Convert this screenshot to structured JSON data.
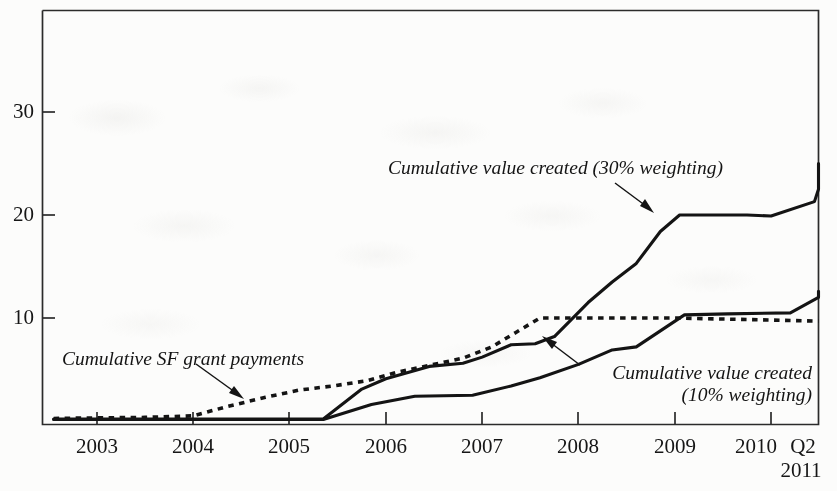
{
  "chart_data": {
    "type": "line",
    "title": "",
    "subtitle": "",
    "xlabel": "",
    "ylabel": "",
    "xlim": [
      2002.5,
      2011.5
    ],
    "ylim": [
      0,
      38
    ],
    "grid": false,
    "legend_position": "inline-annotations",
    "x_tick_labels": [
      "2003",
      "2004",
      "2005",
      "2006",
      "2007",
      "2008",
      "2009",
      "2010",
      "Q2"
    ],
    "x_tick_values": [
      2003,
      2004,
      2005,
      2006,
      2007,
      2008,
      2009,
      2010,
      2011
    ],
    "x_tick_sublabel": "2011",
    "y_tick_labels": [
      "10",
      "20",
      "30"
    ],
    "y_tick_values": [
      10,
      20,
      30
    ],
    "series": [
      {
        "name": "Cumulative SF grant payments",
        "style": "dotted",
        "x": [
          2002.55,
          2003.0,
          2003.5,
          2004.0,
          2004.35,
          2004.75,
          2005.1,
          2005.45,
          2005.8,
          2006.1,
          2006.45,
          2006.8,
          2007.1,
          2007.35,
          2007.6,
          2008.0,
          2009.0,
          2010.0,
          2011.35
        ],
        "values": [
          0.25,
          0.3,
          0.35,
          0.5,
          1.4,
          2.3,
          3.0,
          3.4,
          3.9,
          4.7,
          5.4,
          6.1,
          7.2,
          8.6,
          10.0,
          10.0,
          10.0,
          9.8,
          9.7
        ]
      },
      {
        "name": "Cumulative value created (30% weighting)",
        "style": "solid",
        "x": [
          2002.55,
          2005.35,
          2005.75,
          2006.0,
          2006.45,
          2006.8,
          2007.0,
          2007.3,
          2007.55,
          2007.75,
          2008.1,
          2008.35,
          2008.6,
          2008.85,
          2009.05,
          2009.75,
          2010.0,
          2010.45,
          2010.8,
          2011.0,
          2011.35
        ],
        "values": [
          0.2,
          0.2,
          3.1,
          4.1,
          5.3,
          5.6,
          6.2,
          7.4,
          7.5,
          8.2,
          11.5,
          13.5,
          15.3,
          18.4,
          20.0,
          20.0,
          19.9,
          21.3,
          22.5,
          22.6,
          25.0
        ]
      },
      {
        "name": "Cumulative value created (10% weighting)",
        "style": "solid",
        "x": [
          2002.55,
          2005.35,
          2005.85,
          2006.3,
          2006.9,
          2007.3,
          2007.6,
          2008.0,
          2008.35,
          2008.6,
          2009.1,
          2009.55,
          2010.2,
          2010.5,
          2010.85,
          2011.35
        ],
        "values": [
          0.15,
          0.15,
          1.6,
          2.4,
          2.5,
          3.4,
          4.2,
          5.5,
          6.9,
          7.2,
          10.3,
          10.4,
          10.5,
          12.0,
          12.1,
          12.6
        ]
      }
    ],
    "annotations": [
      {
        "id": "annot-30-weighting",
        "text": "Cumulative value created (30% weighting)",
        "arrow": "down-right"
      },
      {
        "id": "annot-sf-grant-payments",
        "text": "Cumulative SF grant payments",
        "arrow": "down-right"
      },
      {
        "id": "annot-10-weighting",
        "text": "Cumulative value created\n(10% weighting)",
        "arrow": "up-left"
      }
    ],
    "colors": {
      "line": "#141414",
      "axis": "#2b2b2b",
      "background": "#fcfcfb"
    }
  }
}
